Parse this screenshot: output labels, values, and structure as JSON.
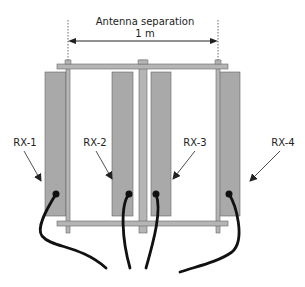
{
  "diagram": {
    "title_line1": "Antenna separation",
    "title_line2": "1 m",
    "antennas": [
      {
        "label": "RX-1"
      },
      {
        "label": "RX-2"
      },
      {
        "label": "RX-3"
      },
      {
        "label": "RX-4"
      }
    ],
    "colors": {
      "panel": "#a9a9a9",
      "frame": "#b5b5b5",
      "stroke": "#555555",
      "cable": "#111111"
    }
  }
}
